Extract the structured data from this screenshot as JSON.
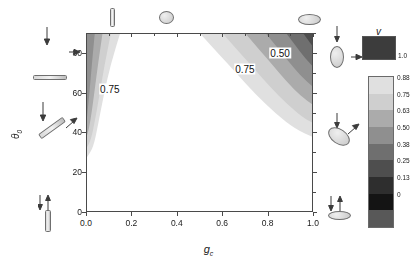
{
  "figure": {
    "type": "contour-plot",
    "xaxis": {
      "label": "g",
      "label_sub": "c",
      "ticks": [
        "0.0",
        "0.2",
        "0.4",
        "0.6",
        "0.8",
        "1.0"
      ],
      "tick_values": [
        0.0,
        0.2,
        0.4,
        0.6,
        0.8,
        1.0
      ],
      "range": [
        0.0,
        1.0
      ]
    },
    "yaxis": {
      "label": "θ",
      "label_sub": "0",
      "ticks": [
        "0",
        "20",
        "40",
        "60",
        "80"
      ],
      "tick_values": [
        0,
        20,
        40,
        60,
        80
      ],
      "range": [
        0,
        90
      ]
    },
    "contour_labels": [
      {
        "text": "0.75",
        "x": 0.105,
        "y": 62
      },
      {
        "text": "0.75",
        "x": 0.7,
        "y": 72
      },
      {
        "text": "0.50",
        "x": 0.855,
        "y": 80
      }
    ]
  },
  "colorbar": {
    "title": "v",
    "top_swatch_label": "1.0",
    "top_swatch_color": "#3c3c3c",
    "tick_labels": [
      "0.88",
      "0.75",
      "0.63",
      "0.50",
      "0.38",
      "0.25",
      "0.13",
      "0"
    ],
    "band_colors": [
      "#e0e0e0",
      "#cfcfcf",
      "#ababab",
      "#8f8f8f",
      "#6f6f6f",
      "#4e4e4e",
      "#2e2e2e",
      "#141414",
      "#585858"
    ]
  },
  "chart_data": {
    "type": "heatmap",
    "title": "",
    "xlabel": "g_c",
    "ylabel": "theta_0",
    "xlim": [
      0.0,
      1.0
    ],
    "ylim": [
      0,
      90
    ],
    "grid": false,
    "legend": "colorbar-right",
    "colorbar_label": "v",
    "levels": [
      0,
      0.13,
      0.25,
      0.38,
      0.5,
      0.63,
      0.75,
      0.88,
      1.0
    ],
    "level_labels": [
      "0",
      "0.13",
      "0.25",
      "0.38",
      "0.50",
      "0.63",
      "0.75",
      "0.88",
      "1.0"
    ],
    "annotations": [
      "0.75",
      "0.75",
      "0.50"
    ],
    "contours_left": [
      {
        "level": 0.88,
        "points": [
          [
            0.145,
            90
          ],
          [
            0.105,
            75
          ],
          [
            0.075,
            60
          ],
          [
            0.05,
            45
          ],
          [
            0.028,
            33
          ],
          [
            0.0,
            28
          ]
        ]
      },
      {
        "level": 0.75,
        "points": [
          [
            0.105,
            90
          ],
          [
            0.078,
            75
          ],
          [
            0.056,
            60
          ],
          [
            0.036,
            47
          ],
          [
            0.018,
            37
          ],
          [
            0.0,
            33
          ]
        ]
      },
      {
        "level": 0.63,
        "points": [
          [
            0.068,
            90
          ],
          [
            0.05,
            76
          ],
          [
            0.034,
            62
          ],
          [
            0.02,
            50
          ],
          [
            0.008,
            42
          ],
          [
            0.0,
            39
          ]
        ]
      },
      {
        "level": 0.5,
        "points": [
          [
            0.034,
            90
          ],
          [
            0.024,
            78
          ],
          [
            0.015,
            66
          ],
          [
            0.006,
            55
          ],
          [
            0.0,
            48
          ]
        ]
      }
    ],
    "contours_right": [
      {
        "level": 0.88,
        "points": [
          [
            0.5,
            90
          ],
          [
            0.58,
            80
          ],
          [
            0.66,
            70
          ],
          [
            0.74,
            60
          ],
          [
            0.83,
            50
          ],
          [
            0.92,
            42
          ],
          [
            1.0,
            38
          ]
        ]
      },
      {
        "level": 0.75,
        "points": [
          [
            0.6,
            90
          ],
          [
            0.67,
            81
          ],
          [
            0.74,
            72
          ],
          [
            0.81,
            63
          ],
          [
            0.88,
            55
          ],
          [
            0.95,
            48
          ],
          [
            1.0,
            45
          ]
        ]
      },
      {
        "level": 0.63,
        "points": [
          [
            0.7,
            90
          ],
          [
            0.76,
            82
          ],
          [
            0.82,
            74
          ],
          [
            0.88,
            66
          ],
          [
            0.94,
            59
          ],
          [
            1.0,
            54
          ]
        ]
      },
      {
        "level": 0.5,
        "points": [
          [
            0.79,
            90
          ],
          [
            0.84,
            83
          ],
          [
            0.89,
            76
          ],
          [
            0.94,
            69
          ],
          [
            1.0,
            63
          ]
        ]
      },
      {
        "level": 0.38,
        "points": [
          [
            0.88,
            90
          ],
          [
            0.92,
            84
          ],
          [
            0.96,
            78
          ],
          [
            1.0,
            73
          ]
        ]
      },
      {
        "level": 0.25,
        "points": [
          [
            0.955,
            90
          ],
          [
            0.98,
            86
          ],
          [
            1.0,
            83
          ]
        ]
      }
    ]
  },
  "glyphs": {
    "top_left": {
      "name": "vertical-rod",
      "shape": "rod-vertical"
    },
    "top_mid": {
      "name": "sphere",
      "shape": "circle"
    },
    "top_right": {
      "name": "horizontal-ellipse",
      "shape": "ellipse-horizontal"
    },
    "left_upper": {
      "name": "horizontal-rod-with-arrows",
      "shape": "rod-horizontal"
    },
    "left_mid": {
      "name": "tilted-rod-with-arrows",
      "shape": "rod-tilted"
    },
    "left_lower": {
      "name": "vertical-rod-with-arrows",
      "shape": "rod-vertical"
    },
    "right_upper": {
      "name": "vertical-ellipse-with-arrows",
      "shape": "ellipse-vertical"
    },
    "right_mid": {
      "name": "tilted-ellipse-with-arrows",
      "shape": "ellipse-tilted"
    },
    "right_lower": {
      "name": "flat-ellipse-with-arrows",
      "shape": "ellipse-flat"
    }
  }
}
